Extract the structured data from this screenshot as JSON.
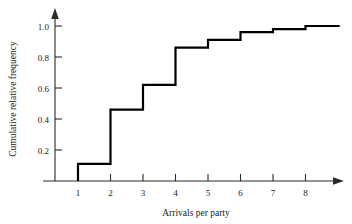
{
  "chart_data": {
    "type": "line",
    "subtype": "step",
    "title": "",
    "xlabel": "Arrivals per party",
    "ylabel": "Cumulative relative frequency",
    "x": [
      1,
      2,
      3,
      4,
      5,
      6,
      7,
      8
    ],
    "values": [
      0.11,
      0.46,
      0.62,
      0.86,
      0.91,
      0.96,
      0.98,
      1.0
    ],
    "series": [
      {
        "name": "Cumulative relative frequency",
        "values": [
          0.11,
          0.46,
          0.62,
          0.86,
          0.91,
          0.96,
          0.98,
          1.0
        ]
      }
    ],
    "xticks": [
      1,
      2,
      3,
      4,
      5,
      6,
      7,
      8
    ],
    "xtick_labels": [
      "1",
      "2",
      "3",
      "4",
      "5",
      "6",
      "7",
      "8"
    ],
    "yticks": [
      0.2,
      0.4,
      0.6,
      0.8,
      1.0
    ],
    "ytick_labels": [
      "0.2",
      "0.4",
      "0.6",
      "0.8",
      "1.0"
    ],
    "xlim": [
      0.35,
      9.0
    ],
    "ylim": [
      0,
      1.08
    ],
    "grid": false,
    "legend": false,
    "axis_arrows": true,
    "line_color": "#000000",
    "axis_color": "#2a2a2a",
    "background": "#ffffff"
  },
  "labels": {
    "xlabel": "Arrivals per party",
    "ylabel": "Cumulative relative frequency"
  }
}
